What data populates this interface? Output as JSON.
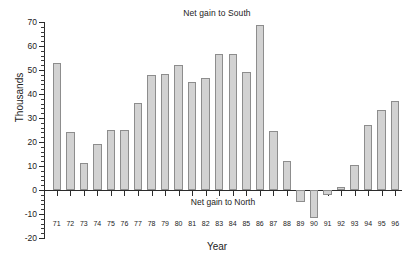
{
  "chart_data": {
    "type": "bar",
    "title": "",
    "annotations": [
      {
        "name": "net-gain-south",
        "text": "Net gain to South",
        "position": "top-center"
      },
      {
        "name": "net-gain-north",
        "text": "Net gain to North",
        "position": "below-zero-line-center"
      }
    ],
    "xlabel": "Year",
    "ylabel": "Thousands",
    "ylim": [
      -20,
      70
    ],
    "yticks": [
      -20,
      -10,
      0,
      10,
      20,
      30,
      40,
      50,
      60,
      70
    ],
    "ytick_labels": [
      "-20",
      "-10",
      "0",
      "10",
      "20",
      "30",
      "40",
      "50",
      "60",
      "70"
    ],
    "yminor_step": 2,
    "grid": false,
    "legend": null,
    "categories": [
      "71",
      "72",
      "73",
      "74",
      "75",
      "76",
      "77",
      "78",
      "79",
      "80",
      "81",
      "82",
      "83",
      "84",
      "85",
      "86",
      "87",
      "88",
      "89",
      "90",
      "91",
      "92",
      "93",
      "94",
      "95",
      "96"
    ],
    "values": [
      52.8,
      24.0,
      11.2,
      19.1,
      24.8,
      24.9,
      36.2,
      47.8,
      48.3,
      52.1,
      45.1,
      46.6,
      56.8,
      56.8,
      49.2,
      68.8,
      24.4,
      12.2,
      -4.8,
      -11.6,
      -2.0,
      1.1,
      10.6,
      27.1,
      33.4,
      37.2
    ],
    "bar_fill_color": "#d2d2d2",
    "bar_edge_color": "#8d8d8d",
    "axis_color": "#2b2b2b",
    "background_color": "#ffffff"
  }
}
